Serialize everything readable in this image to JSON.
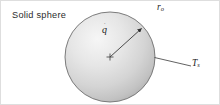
{
  "figure": {
    "canvas": {
      "width": 220,
      "height": 105,
      "background": "#ffffff"
    },
    "border": {
      "visible": true,
      "color": "#d8d8d8"
    },
    "labels": {
      "solid_sphere": "Solid sphere",
      "outer_radius": "r",
      "outer_radius_sub": "o",
      "generation": "q",
      "generation_accent": "˙",
      "surface_temperature": "T",
      "surface_temperature_sub": "s"
    },
    "sphere": {
      "center_x": 110,
      "center_y": 57,
      "radius": 45,
      "outline_color": "#6b6b6b",
      "fill_light": "#f2f2f2",
      "fill_dark": "#b4b4b4",
      "center_marker": "+"
    },
    "leaders": [
      {
        "name": "radius-arrow",
        "from_x": 110,
        "from_y": 57,
        "to_x": 142,
        "to_y": 28,
        "arrowhead": true,
        "color": "#3a3a3a"
      },
      {
        "name": "surface-temperature-leader",
        "from_x": 155,
        "from_y": 57,
        "to_x": 191,
        "to_y": 66,
        "arrowhead": false,
        "color": "#3a3a3a"
      }
    ]
  }
}
